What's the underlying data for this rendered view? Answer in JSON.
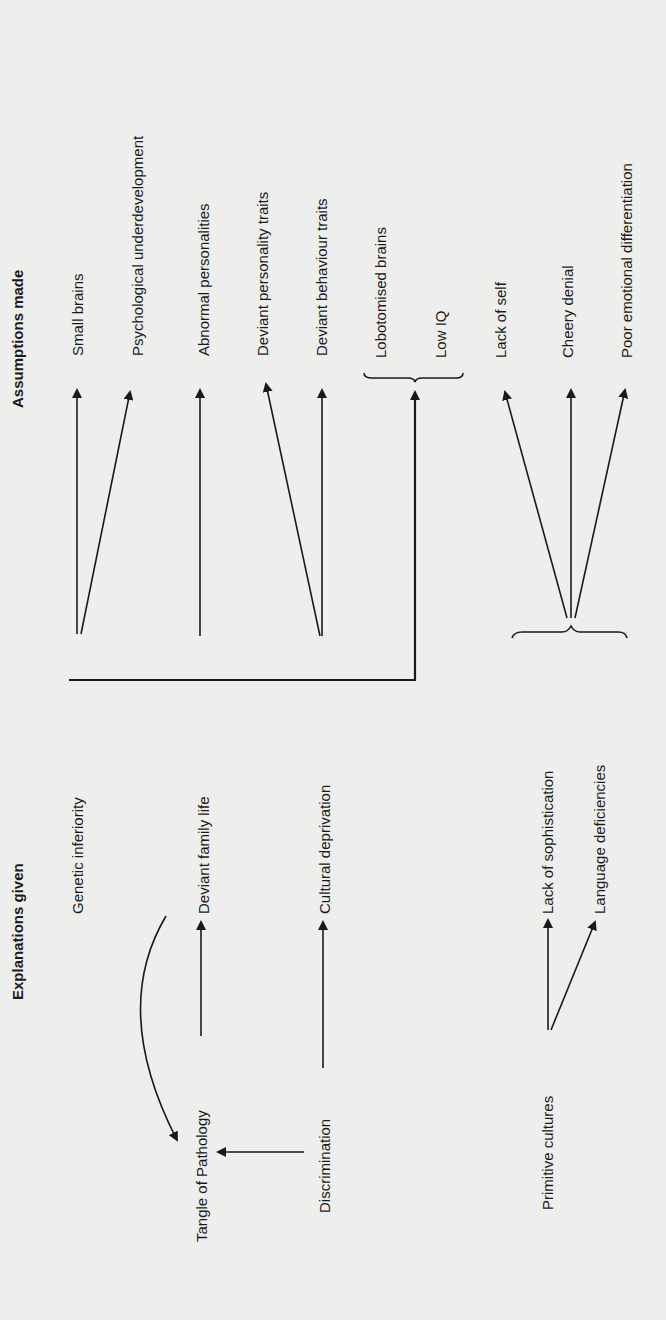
{
  "headers": {
    "explanations": "Explanations given",
    "assumptions": "Assumptions made"
  },
  "explanations": {
    "genetic_inferiority": "Genetic inferiority",
    "deviant_family_life": "Deviant family life",
    "cultural_deprivation": "Cultural deprivation",
    "lack_of_sophistication": "Lack of sophistication",
    "language_deficiencies": "Language deficiencies",
    "tangle_of_pathology": "Tangle of Pathology",
    "discrimination": "Discrimination",
    "primitive_cultures": "Primitive cultures"
  },
  "assumptions": {
    "small_brains": "Small brains",
    "psychological_underdevelopment": "Psychological underdevelopment",
    "abnormal_personalities": "Abnormal personalities",
    "deviant_personality_traits": "Deviant personality traits",
    "deviant_behaviour_traits": "Deviant behaviour traits",
    "lobotomised_brains": "Lobotomised brains",
    "low_iq": "Low IQ",
    "lack_of_self": "Lack of self",
    "cheery_denial": "Cheery denial",
    "poor_emotional_differentiation": "Poor emotional differentiation"
  },
  "colors": {
    "background": "#eeeeec",
    "ink": "#1a1a1a"
  }
}
